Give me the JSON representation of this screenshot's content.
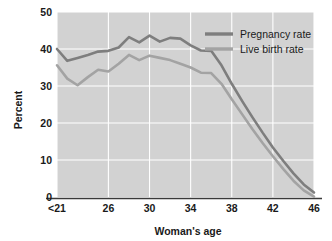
{
  "chart_data": {
    "type": "line",
    "title": "",
    "xlabel": "Woman's age",
    "ylabel": "Percent",
    "ylim": [
      0,
      50
    ],
    "yticks": [
      0,
      10,
      20,
      30,
      40,
      50
    ],
    "ytick_labels": [
      "0",
      "10",
      "20",
      "30",
      "40",
      "50"
    ],
    "xlim": [
      21,
      46
    ],
    "xticks": [
      21,
      26,
      30,
      34,
      38,
      42,
      46
    ],
    "xtick_labels": [
      "<21",
      "26",
      "30",
      "34",
      "38",
      "42",
      "46"
    ],
    "grid": true,
    "grid_color": "#ffffff",
    "plot_background": "#d2d2d2",
    "legend_position": "upper right",
    "x": [
      21,
      22,
      23,
      24,
      25,
      26,
      27,
      28,
      29,
      30,
      31,
      32,
      33,
      34,
      35,
      36,
      37,
      38,
      39,
      40,
      41,
      42,
      43,
      44,
      45,
      46
    ],
    "series": [
      {
        "name": "Pregnancy rate",
        "color": "#7e7e7e",
        "values": [
          40.0,
          36.8,
          37.6,
          38.4,
          39.3,
          39.5,
          40.4,
          43.2,
          41.8,
          43.6,
          42.0,
          43.0,
          42.8,
          41.0,
          39.6,
          39.5,
          35.6,
          30.6,
          26.0,
          21.6,
          17.4,
          13.4,
          9.8,
          6.4,
          3.4,
          1.2
        ]
      },
      {
        "name": "Live birth rate",
        "color": "#a3a3a3",
        "values": [
          35.6,
          32.0,
          30.2,
          32.4,
          34.4,
          33.9,
          36.0,
          38.4,
          37.0,
          38.2,
          37.6,
          37.0,
          36.0,
          35.0,
          33.6,
          33.5,
          30.6,
          26.4,
          22.4,
          18.4,
          14.6,
          11.0,
          7.6,
          4.4,
          1.8,
          0.1
        ]
      }
    ]
  },
  "legend": {
    "items": [
      {
        "label": "Pregnancy rate",
        "color": "#7e7e7e"
      },
      {
        "label": "Live birth rate",
        "color": "#a3a3a3"
      }
    ]
  },
  "axes": {
    "y_title": "Percent",
    "x_title": "Woman's age"
  }
}
